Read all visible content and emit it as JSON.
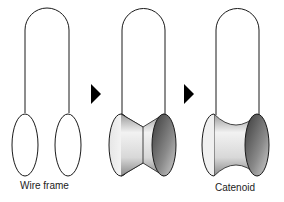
{
  "panels": [
    {
      "id": "wire-frame",
      "label": "Wire frame",
      "surface": "none"
    },
    {
      "id": "intermediate",
      "label": "",
      "surface": "cone-like film"
    },
    {
      "id": "catenoid",
      "label": "Catenoid",
      "surface": "catenoid"
    }
  ],
  "arrows": [
    {
      "from": "wire-frame",
      "to": "intermediate",
      "glyph": "triangle-right"
    },
    {
      "from": "intermediate",
      "to": "catenoid",
      "glyph": "triangle-right"
    }
  ],
  "colors": {
    "stroke": "#1a1a1a",
    "arrow": "#000000",
    "shade_light": "#f4f4f4",
    "shade_dark": "#555555"
  },
  "labels": {
    "wire_frame": "Wire frame",
    "catenoid": "Catenoid"
  }
}
